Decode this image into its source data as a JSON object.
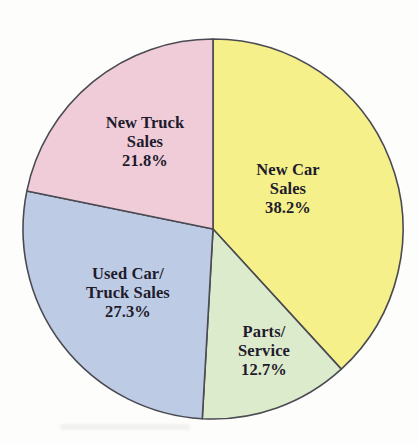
{
  "chart_data": {
    "type": "pie",
    "title": "",
    "subtitle": "",
    "xlabel": "",
    "ylabel": "",
    "legend": "none",
    "grid": false,
    "units": "percent",
    "start_angle_deg": 0,
    "direction": "clockwise",
    "categories": [
      "New Car Sales",
      "Parts/Service",
      "Used Car/Truck Sales",
      "New Truck Sales"
    ],
    "values": [
      38.2,
      12.7,
      27.3,
      21.8
    ],
    "slices": [
      {
        "id": "new-car-sales",
        "label_line1": "New Car",
        "label_line2": "Sales",
        "label_full": "New Car Sales",
        "value": 38.2,
        "value_text": "38.2%",
        "color": "#F5F08A",
        "start_deg": 0,
        "end_deg": 137.52
      },
      {
        "id": "parts-service",
        "label_line1": "Parts/",
        "label_line2": "Service",
        "label_full": "Parts/Service",
        "value": 12.7,
        "value_text": "12.7%",
        "color": "#DDEBCD",
        "start_deg": 137.52,
        "end_deg": 183.24
      },
      {
        "id": "used-car-truck-sales",
        "label_line1": "Used Car/",
        "label_line2": "Truck Sales",
        "label_full": "Used Car/Truck Sales",
        "value": 27.3,
        "value_text": "27.3%",
        "color": "#BDCCE4",
        "start_deg": 183.24,
        "end_deg": 281.52
      },
      {
        "id": "new-truck-sales",
        "label_line1": "New Truck",
        "label_line2": "Sales",
        "label_full": "New Truck Sales",
        "value": 21.8,
        "value_text": "21.8%",
        "color": "#EFCCD8",
        "start_deg": 281.52,
        "end_deg": 360
      }
    ],
    "style": {
      "outline_color": "#4a4a52",
      "text_color": "#1d1b2c",
      "background": "#fdfdfb",
      "center_x": 213,
      "center_y": 229,
      "radius": 190
    }
  }
}
